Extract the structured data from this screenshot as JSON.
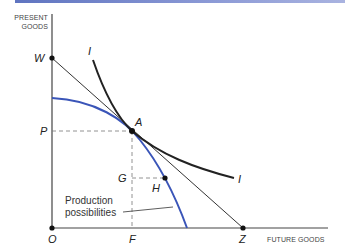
{
  "diagram": {
    "axes": {
      "y_label_line1": "PRESENT",
      "y_label_line2": "GOODS",
      "x_label": "FUTURE GOODS"
    },
    "points": {
      "W": "W",
      "P": "P",
      "A": "A",
      "G": "G",
      "H": "H",
      "O": "O",
      "F": "F",
      "Z": "Z"
    },
    "curves": {
      "indifference_top": "I",
      "indifference_bottom": "I",
      "production_line1": "Production",
      "production_line2": "possibilities"
    },
    "colors": {
      "production_curve": "#3a55b8",
      "ink": "#222222",
      "header_bar": "#6b7fc4"
    }
  }
}
